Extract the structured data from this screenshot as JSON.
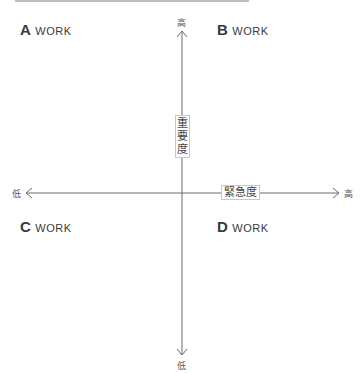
{
  "quadrants": {
    "a": {
      "letter": "A",
      "label": "WORK"
    },
    "b": {
      "letter": "B",
      "label": "WORK"
    },
    "c": {
      "letter": "C",
      "label": "WORK"
    },
    "d": {
      "letter": "D",
      "label": "WORK"
    }
  },
  "axes": {
    "vertical": {
      "title": "重要度",
      "high": "高",
      "low": "低"
    },
    "horizontal": {
      "title": "緊急度",
      "high": "高",
      "low": "低"
    }
  },
  "colors": {
    "axis": "#6a6a6a",
    "text": "#3a3a3a"
  }
}
